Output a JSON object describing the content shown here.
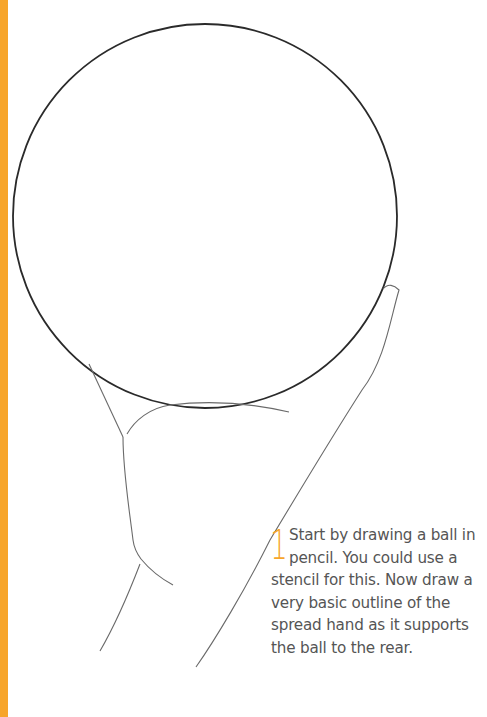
{
  "page": {
    "accent_color": "#f7a52a",
    "text_color": "#555555"
  },
  "illustration": {
    "subject": "ball-held-by-spread-hand-sketch",
    "ball": {
      "cx": 205,
      "cy": 216,
      "r": 192
    }
  },
  "step": {
    "number": "1",
    "text": "Start by drawing a ball in pencil. You could use a stencil for this. Now draw a very basic outline of the spread hand as it supports the ball to the rear."
  }
}
